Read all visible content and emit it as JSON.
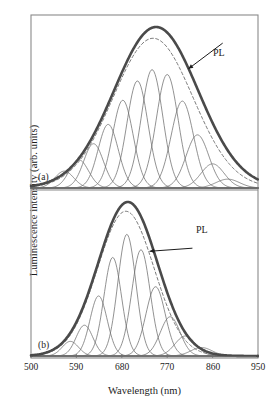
{
  "figure": {
    "type": "multi-panel-spectra",
    "y_axis_label": "Luminescence intensity (arb. units)",
    "x_axis_label": "Wavelength (nm)",
    "x_ticks": [
      "500",
      "590",
      "680",
      "770",
      "860",
      "950"
    ],
    "panel_a_label": "(a)",
    "panel_b_label": "(b)",
    "annotation_a": "PL",
    "annotation_b": "PL",
    "colors": {
      "envelope": "#4a4a4a",
      "component": "#6e6e6e",
      "dashed": "#7a7a7a",
      "axis": "#8a8a8a",
      "text": "#1c1c1c",
      "background": "#ffffff"
    }
  },
  "chart_data": {
    "type": "line",
    "title": "",
    "xlabel": "Wavelength (nm)",
    "ylabel": "Luminescence intensity (arb. units)",
    "xlim": [
      500,
      950
    ],
    "ylim": [
      0,
      1.05
    ],
    "xticks": [
      500,
      590,
      680,
      770,
      860,
      950
    ],
    "grid": false,
    "legend": "none",
    "panels": [
      {
        "label": "(a)",
        "annotation": "PL",
        "annotation_text_x": 880,
        "annotation_text_y": 0.9,
        "annotation_arrow_to_x": 812,
        "annotation_arrow_to_y": 0.74,
        "envelope": {
          "name": "PL envelope",
          "style": "thick-solid",
          "peak_x": 748,
          "peak_y": 1.0,
          "fwhm": 196
        },
        "dashed_curve": {
          "name": "fit sum (dashed)",
          "style": "dashed",
          "peak_x": 742,
          "peak_y": 0.93,
          "fwhm": 186
        },
        "components": [
          {
            "center": 566,
            "height": 0.105,
            "width": 44
          },
          {
            "center": 595,
            "height": 0.175,
            "width": 45
          },
          {
            "center": 624,
            "height": 0.275,
            "width": 46
          },
          {
            "center": 653,
            "height": 0.395,
            "width": 47
          },
          {
            "center": 682,
            "height": 0.545,
            "width": 48
          },
          {
            "center": 711,
            "height": 0.665,
            "width": 49
          },
          {
            "center": 740,
            "height": 0.735,
            "width": 50
          },
          {
            "center": 770,
            "height": 0.705,
            "width": 51
          },
          {
            "center": 800,
            "height": 0.54,
            "width": 52
          },
          {
            "center": 830,
            "height": 0.33,
            "width": 53
          },
          {
            "center": 860,
            "height": 0.15,
            "width": 54
          },
          {
            "center": 890,
            "height": 0.055,
            "width": 55
          }
        ]
      },
      {
        "label": "(b)",
        "annotation": "PL",
        "annotation_text_x": 820,
        "annotation_text_y": 0.7,
        "annotation_arrow_to_x": 735,
        "annotation_arrow_to_y": 0.68,
        "envelope": {
          "name": "PL envelope",
          "style": "thick-solid",
          "peak_x": 692,
          "peak_y": 1.0,
          "fwhm": 138
        },
        "dashed_curve": {
          "name": "fit sum (dashed)",
          "style": "dashed",
          "peak_x": 688,
          "peak_y": 0.94,
          "fwhm": 132
        },
        "components": [
          {
            "center": 578,
            "height": 0.095,
            "width": 38
          },
          {
            "center": 606,
            "height": 0.2,
            "width": 39
          },
          {
            "center": 634,
            "height": 0.39,
            "width": 40
          },
          {
            "center": 662,
            "height": 0.64,
            "width": 41
          },
          {
            "center": 690,
            "height": 0.79,
            "width": 42
          },
          {
            "center": 718,
            "height": 0.69,
            "width": 43
          },
          {
            "center": 747,
            "height": 0.45,
            "width": 45
          },
          {
            "center": 776,
            "height": 0.255,
            "width": 46
          },
          {
            "center": 806,
            "height": 0.13,
            "width": 48
          },
          {
            "center": 838,
            "height": 0.055,
            "width": 50
          }
        ]
      }
    ]
  }
}
